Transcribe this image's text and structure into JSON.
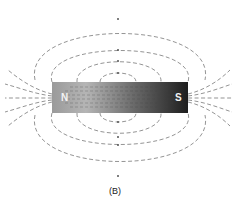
{
  "figure": {
    "caption": "(B)",
    "magnet": {
      "north_label": "N",
      "south_label": "S",
      "gradient_left": "#b8b8b8",
      "gradient_mid": "#8a8a8a",
      "gradient_right": "#2a2a2a"
    },
    "field_line_color": "#555555"
  }
}
